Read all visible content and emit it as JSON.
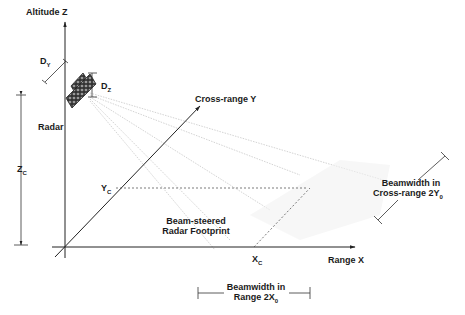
{
  "axes": {
    "z_label": "Altitude Z",
    "y_label": "Cross-range Y",
    "x_label": "Range X"
  },
  "radar": {
    "label": "Radar",
    "dy_label": "D",
    "dy_sub": "Y",
    "dz_label": "D",
    "dz_sub": "Z"
  },
  "dimensions": {
    "zc_label": "Z",
    "zc_sub": "C",
    "yc_label": "Y",
    "yc_sub": "C",
    "xc_label": "X",
    "xc_sub": "C"
  },
  "footprint": {
    "line1": "Beam-steered",
    "line2": "Radar Footprint"
  },
  "beamwidth_cross": {
    "line1": "Beamwidth in",
    "line2": "Cross-range 2Y",
    "sub": "0"
  },
  "beamwidth_range": {
    "line1": "Beamwidth in",
    "line2": "Range 2X",
    "sub": "0"
  },
  "colors": {
    "axis": "#222222",
    "beam": "#c8c8c8",
    "panel": "#555555"
  }
}
